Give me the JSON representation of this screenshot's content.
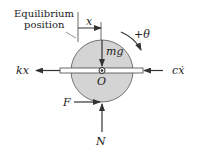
{
  "diagram": {
    "equilibrium_label_line1": "Equilibrium",
    "equilibrium_label_line2": "position",
    "labels": {
      "displacement": "x",
      "rotation": "+θ",
      "weight": "mg",
      "center": "O",
      "spring_force": "kx",
      "damper_force": "cẋ",
      "friction": "F",
      "normal": "N"
    },
    "colors": {
      "disk_fill": "#d4d4d4",
      "line": "#333333",
      "axle_fill": "#ffffff"
    }
  }
}
